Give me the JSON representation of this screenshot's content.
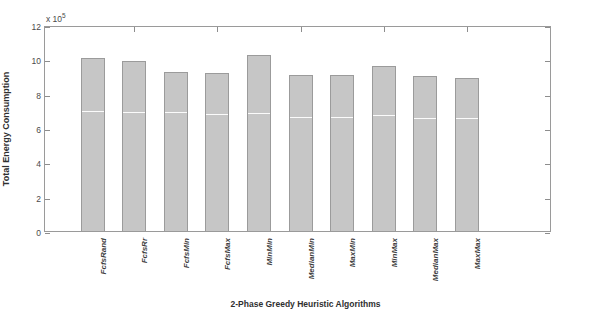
{
  "chart_data": {
    "type": "bar",
    "title": "",
    "xlabel": "2-Phase Greedy Heuristic Algorithms",
    "ylabel": "Total Energy Consumption",
    "y_exponent_label": "x 10",
    "y_exponent": "5",
    "ylim": [
      0,
      12
    ],
    "yticks": [
      0,
      2,
      4,
      6,
      8,
      10,
      12
    ],
    "ytick_labels": [
      "0",
      "2",
      "4",
      "6",
      "8",
      "10",
      "12"
    ],
    "grid": false,
    "legend": "none",
    "categories": [
      "FcfsRand",
      "FcfsRr",
      "FcfsMin",
      "FcfsMax",
      "MinMin",
      "MedianMin",
      "MaxMin",
      "MinMax",
      "MedianMax",
      "MaxMax"
    ],
    "values": [
      10.07,
      9.9,
      9.26,
      9.2,
      10.25,
      9.09,
      9.09,
      9.6,
      9.03,
      8.91
    ],
    "segment_marks": [
      6.95,
      6.9,
      6.85,
      6.75,
      6.8,
      6.6,
      6.6,
      6.7,
      6.55,
      6.5
    ],
    "bar_color": "#c6c6c6",
    "bar_edge_color": "#9b9b9b",
    "axis_color": "#9a9a9a",
    "background": "#ffffff"
  }
}
